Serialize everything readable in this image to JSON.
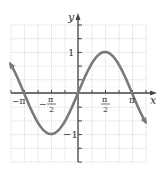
{
  "chart_data": {
    "type": "line",
    "title": "",
    "function": "y = sin x",
    "xlabel": "x",
    "ylabel": "y",
    "xlim": [
      -3.927,
      3.927
    ],
    "ylim": [
      -1.67,
      1.67
    ],
    "grid": true,
    "grid_step_x": "π/4",
    "grid_step_y": 0.333,
    "x_ticks": [
      {
        "value": -3.14159,
        "label": "−π"
      },
      {
        "value": -1.5708,
        "label_num": "π",
        "label_den": "2",
        "sign": "−"
      },
      {
        "value": 1.5708,
        "label_num": "π",
        "label_den": "2",
        "sign": ""
      },
      {
        "value": 3.14159,
        "label": "π"
      }
    ],
    "y_ticks": [
      {
        "value": 1,
        "label": "1"
      },
      {
        "value": -1,
        "label": "−1"
      }
    ],
    "series": [
      {
        "name": "sin x",
        "x": [
          -3.927,
          -3.1416,
          -2.3562,
          -1.5708,
          -0.7854,
          0,
          0.7854,
          1.5708,
          2.3562,
          3.1416,
          3.927
        ],
        "values": [
          0.707,
          0,
          -0.707,
          -1,
          -0.707,
          0,
          0.707,
          1,
          0.707,
          0,
          -0.707
        ],
        "color": "#7a7a7a",
        "arrows_at_ends": true
      }
    ]
  },
  "labels": {
    "x_axis": "x",
    "y_axis": "y",
    "neg_pi": "−π",
    "pi": "π",
    "pi_num": "π",
    "two": "2",
    "minus": "−",
    "one": "1",
    "neg_one": "−1"
  },
  "colors": {
    "grid": "#c8c8c8",
    "axis": "#444444",
    "curve": "#7a7a7a",
    "text": "#333333"
  }
}
